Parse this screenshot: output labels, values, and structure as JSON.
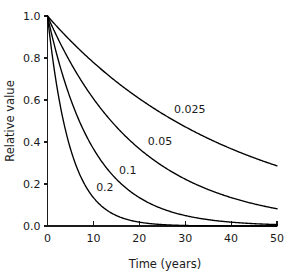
{
  "chart_data": {
    "type": "line",
    "title": "",
    "xlabel": "Time (years)",
    "ylabel": "Relative value",
    "xlim": [
      0,
      50
    ],
    "ylim": [
      0,
      1.0
    ],
    "grid": false,
    "legend_position": "inline-curve-labels",
    "xticks": [
      0,
      10,
      20,
      30,
      40,
      50
    ],
    "xticklabels": [
      "0",
      "10",
      "20",
      "30",
      "40",
      "50"
    ],
    "yticks": [
      0.0,
      0.2,
      0.4,
      0.6,
      0.8,
      1.0
    ],
    "yticklabels": [
      "0.0",
      "0.2",
      "0.4",
      "0.6",
      "0.8",
      "1.0"
    ],
    "x": [
      0,
      2,
      4,
      6,
      8,
      10,
      12,
      14,
      16,
      18,
      20,
      22,
      24,
      26,
      28,
      30,
      32,
      34,
      36,
      38,
      40,
      42,
      44,
      46,
      48,
      50
    ],
    "series": [
      {
        "name": "0.025",
        "rate": 0.025,
        "label": "0.025",
        "label_x": 31,
        "label_y": 0.555,
        "values": [
          1.0,
          0.951,
          0.905,
          0.861,
          0.819,
          0.779,
          0.741,
          0.705,
          0.67,
          0.638,
          0.607,
          0.577,
          0.549,
          0.522,
          0.497,
          0.472,
          0.449,
          0.427,
          0.407,
          0.387,
          0.368,
          0.35,
          0.333,
          0.317,
          0.301,
          0.287
        ]
      },
      {
        "name": "0.05",
        "rate": 0.05,
        "label": "0.05",
        "label_x": 24.5,
        "label_y": 0.405,
        "values": [
          1.0,
          0.905,
          0.819,
          0.741,
          0.67,
          0.607,
          0.549,
          0.497,
          0.449,
          0.407,
          0.368,
          0.333,
          0.301,
          0.273,
          0.247,
          0.223,
          0.202,
          0.183,
          0.165,
          0.15,
          0.135,
          0.122,
          0.111,
          0.1,
          0.091,
          0.082
        ]
      },
      {
        "name": "0.1",
        "rate": 0.1,
        "label": "0.1",
        "label_x": 17.5,
        "label_y": 0.265,
        "values": [
          1.0,
          0.819,
          0.67,
          0.549,
          0.449,
          0.368,
          0.301,
          0.247,
          0.202,
          0.165,
          0.135,
          0.111,
          0.091,
          0.074,
          0.061,
          0.05,
          0.041,
          0.033,
          0.027,
          0.022,
          0.018,
          0.015,
          0.012,
          0.01,
          0.008,
          0.007
        ]
      },
      {
        "name": "0.2",
        "rate": 0.2,
        "label": "0.2",
        "label_x": 12.5,
        "label_y": 0.185,
        "values": [
          1.0,
          0.67,
          0.449,
          0.301,
          0.202,
          0.135,
          0.091,
          0.061,
          0.041,
          0.027,
          0.018,
          0.012,
          0.008,
          0.006,
          0.004,
          0.002,
          0.002,
          0.001,
          0.001,
          0.001,
          0.0,
          0.0,
          0.0,
          0.0,
          0.0,
          0.0
        ]
      }
    ],
    "colors": {
      "curve": "#000000",
      "axis": "#1a1a1a",
      "text": "#1a1a1a",
      "background": "#ffffff"
    }
  }
}
